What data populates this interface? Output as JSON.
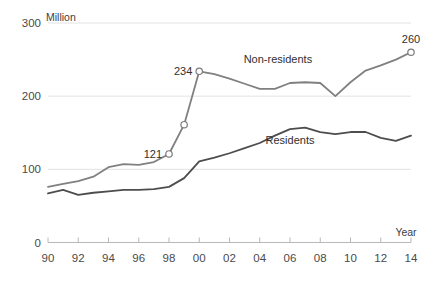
{
  "chart_data": {
    "type": "line",
    "title": "",
    "subtitle": "",
    "unit_label": "Million",
    "xlabel": "Year",
    "ylabel": "",
    "x": [
      1990,
      1991,
      1992,
      1993,
      1994,
      1995,
      1996,
      1997,
      1998,
      1999,
      2000,
      2001,
      2002,
      2003,
      2004,
      2005,
      2006,
      2007,
      2008,
      2009,
      2010,
      2011,
      2012,
      2013,
      2014
    ],
    "xtick_values": [
      1990,
      1992,
      1994,
      1996,
      1998,
      2000,
      2002,
      2004,
      2006,
      2008,
      2010,
      2012,
      2014
    ],
    "xtick_labels": [
      "90",
      "92",
      "94",
      "96",
      "98",
      "00",
      "02",
      "04",
      "06",
      "08",
      "10",
      "12",
      "14"
    ],
    "ytick_values": [
      0,
      100,
      200,
      300
    ],
    "ytick_labels": [
      "0",
      "100",
      "200",
      "300"
    ],
    "ylim": [
      0,
      300
    ],
    "grid": "horizontal",
    "legend_position": "inline-annotations",
    "series": [
      {
        "name": "Non-residents",
        "color": "#808080",
        "values": [
          76,
          80,
          84,
          90,
          103,
          107,
          106,
          110,
          121,
          161,
          234,
          230,
          224,
          217,
          210,
          210,
          218,
          219,
          218,
          200,
          219,
          235,
          242,
          250,
          260
        ]
      },
      {
        "name": "Residents",
        "color": "#4d4d4d",
        "values": [
          67,
          72,
          65,
          68,
          70,
          72,
          72,
          73,
          76,
          88,
          111,
          116,
          122,
          129,
          136,
          146,
          155,
          157,
          151,
          148,
          151,
          151,
          143,
          139,
          146
        ]
      }
    ],
    "annotations": [
      {
        "label": "121",
        "x": 1998,
        "y": 121,
        "marker": true
      },
      {
        "label": "",
        "x": 1999,
        "y": 161,
        "marker": true
      },
      {
        "label": "234",
        "x": 2000,
        "y": 234,
        "marker": true
      },
      {
        "label": "260",
        "x": 2014,
        "y": 260,
        "marker": true
      }
    ],
    "series_labels": [
      {
        "text": "Non-residents",
        "x": 2005.2,
        "y": 246
      },
      {
        "text": "Residents",
        "x": 2006.0,
        "y": 134
      }
    ]
  }
}
